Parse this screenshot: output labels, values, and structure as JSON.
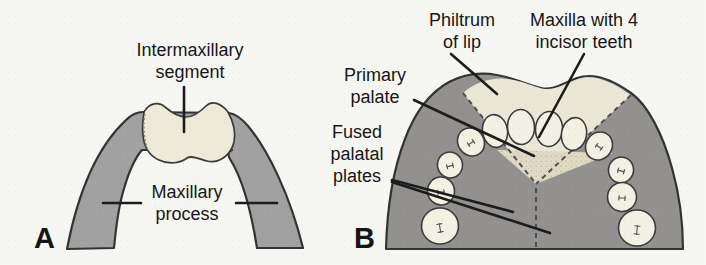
{
  "figure_type": "embryology-palate-development-diagram",
  "colors": {
    "background": "#f6f6f3",
    "band_gray": "#a1a1a1",
    "dome_gray": "#93918f",
    "cream": "#eeead9",
    "philtrum_cream": "#ebe7d6",
    "palate_stipple": "#e0dac4",
    "tooth": "#f3f0e4",
    "outline": "#333333",
    "leader": "#1c1c1c"
  },
  "panel_a": {
    "letter": "A",
    "labels": {
      "intermaxillary_segment": "Intermaxillary\nsegment",
      "maxillary_process": "Maxillary\nprocess"
    }
  },
  "panel_b": {
    "letter": "B",
    "labels": {
      "philtrum": "Philtrum\nof lip",
      "maxilla": "Maxilla with 4\nincisor teeth",
      "primary_palate": "Primary\npalate",
      "fused_palatal_plates": "Fused\npalatal\nplates"
    }
  }
}
